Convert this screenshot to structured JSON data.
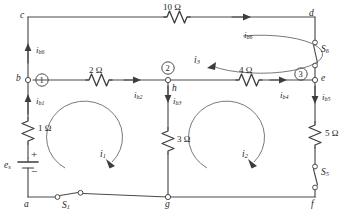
{
  "diagram": {
    "type": "electrical-circuit-schematic",
    "width": 350,
    "height": 215,
    "background_color": "#ffffff",
    "line_color": "#4a4a4a",
    "text_color": "#262626"
  },
  "nodes": [
    {
      "id": "a",
      "label": "a",
      "x": 28,
      "y": 197
    },
    {
      "id": "b",
      "label": "b",
      "x": 28,
      "y": 80
    },
    {
      "id": "c",
      "label": "c",
      "x": 28,
      "y": 17
    },
    {
      "id": "d",
      "label": "d",
      "x": 315,
      "y": 17
    },
    {
      "id": "e",
      "label": "e",
      "x": 315,
      "y": 80
    },
    {
      "id": "f",
      "label": "f",
      "x": 315,
      "y": 197
    },
    {
      "id": "g",
      "label": "g",
      "x": 168,
      "y": 197
    },
    {
      "id": "h",
      "label": "h",
      "x": 168,
      "y": 80
    }
  ],
  "numbered_nodes": [
    {
      "number": "1",
      "at_node": "b",
      "x": 42,
      "y": 80
    },
    {
      "number": "2",
      "at_node": "h",
      "x": 168,
      "y": 71
    },
    {
      "number": "3",
      "at_node": "e",
      "x": 303,
      "y": 75
    }
  ],
  "resistors": [
    {
      "id": "R10",
      "value": "10",
      "unit": "Ω",
      "label": "10 Ω",
      "orientation": "horizontal",
      "branch": "c-d",
      "x": 175,
      "y": 17
    },
    {
      "id": "R2",
      "value": "2",
      "unit": "Ω",
      "label": "2 Ω",
      "orientation": "horizontal",
      "branch": "b-h",
      "x": 98,
      "y": 80
    },
    {
      "id": "R4",
      "value": "4",
      "unit": "Ω",
      "label": "4 Ω",
      "orientation": "horizontal",
      "branch": "h-e",
      "x": 248,
      "y": 80
    },
    {
      "id": "R3",
      "value": "3",
      "unit": "Ω",
      "label": "3 Ω",
      "orientation": "vertical",
      "branch": "h-g",
      "x": 168,
      "y": 140
    },
    {
      "id": "R1",
      "value": "1",
      "unit": "Ω",
      "label": "1 Ω",
      "orientation": "vertical",
      "branch": "b-source",
      "x": 28,
      "y": 128
    },
    {
      "id": "R5",
      "value": "5",
      "unit": "Ω",
      "label": "5 Ω",
      "orientation": "vertical",
      "branch": "e-f",
      "x": 315,
      "y": 133
    }
  ],
  "source": {
    "id": "es",
    "label": "e",
    "subscript": "s",
    "plus_sign": "+",
    "minus_sign": "−",
    "type": "voltage-source-battery",
    "x": 28,
    "y": 167
  },
  "switches": [
    {
      "id": "S1",
      "label": "S",
      "subscript": "1",
      "orientation": "horizontal",
      "branch": "a-g",
      "x": 66,
      "y": 197,
      "state": "open"
    },
    {
      "id": "S5",
      "label": "S",
      "subscript": "5",
      "orientation": "vertical",
      "branch": "R5-f",
      "x": 315,
      "y": 172,
      "state": "open"
    },
    {
      "id": "S6",
      "label": "S",
      "subscript": "6",
      "orientation": "vertical",
      "branch": "d-e",
      "x": 315,
      "y": 48,
      "state": "open"
    }
  ],
  "branch_currents": [
    {
      "id": "ib6_left",
      "label": "i",
      "subscript": "b6",
      "direction": "up",
      "x": 40,
      "y": 52,
      "branch": "b-c"
    },
    {
      "id": "ib6_top",
      "label": "i",
      "subscript": "b6",
      "direction": "right",
      "x": 248,
      "y": 38,
      "branch": "c-d"
    },
    {
      "id": "ib1",
      "label": "i",
      "subscript": "b1",
      "direction": "up",
      "x": 40,
      "y": 103,
      "branch": "a-b"
    },
    {
      "id": "ib2",
      "label": "i",
      "subscript": "b2",
      "direction": "right",
      "x": 139,
      "y": 98,
      "branch": "b-h"
    },
    {
      "id": "ib3",
      "label": "i",
      "subscript": "b3",
      "direction": "down",
      "x": 177,
      "y": 101,
      "branch": "h-g"
    },
    {
      "id": "ib4",
      "label": "i",
      "subscript": "b4",
      "direction": "right",
      "x": 284,
      "y": 98,
      "branch": "h-e"
    },
    {
      "id": "ib5",
      "label": "i",
      "subscript": "b5",
      "direction": "down",
      "x": 326,
      "y": 99,
      "branch": "e-f"
    }
  ],
  "mesh_currents": [
    {
      "id": "i1",
      "label": "i",
      "subscript": "1",
      "rotation": "clockwise",
      "x": 105,
      "y": 156,
      "mesh": "left-lower-loop"
    },
    {
      "id": "i2",
      "label": "i",
      "subscript": "2",
      "rotation": "clockwise",
      "x": 247,
      "y": 156,
      "mesh": "right-lower-loop"
    },
    {
      "id": "i3",
      "label": "i",
      "subscript": "3",
      "rotation": "clockwise",
      "x": 197,
      "y": 62,
      "mesh": "upper-loop"
    }
  ]
}
